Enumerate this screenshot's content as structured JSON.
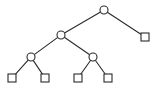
{
  "figure": {
    "width": 159,
    "height": 97,
    "background_color": "#ffffff",
    "stroke_color": "#2b2b2b",
    "node_fill_color": "#ffffff"
  },
  "chart_data": {
    "type": "diagram",
    "diagram_type": "binary-tree",
    "title": "",
    "xlabel": "",
    "ylabel": "",
    "grid": false,
    "legend": "none",
    "node_shapes": {
      "internal": "circle",
      "leaf": "square"
    },
    "node_size": {
      "circle_diameter": 8,
      "square_side": 8
    },
    "nodes": [
      {
        "id": "n0",
        "shape": "circle",
        "level": 0,
        "x": 104,
        "y": 10,
        "label": ""
      },
      {
        "id": "n1",
        "shape": "circle",
        "level": 1,
        "x": 61,
        "y": 35,
        "label": ""
      },
      {
        "id": "n2",
        "shape": "square",
        "level": 1,
        "x": 145,
        "y": 37,
        "label": ""
      },
      {
        "id": "n3",
        "shape": "circle",
        "level": 2,
        "x": 31,
        "y": 57,
        "label": ""
      },
      {
        "id": "n4",
        "shape": "circle",
        "level": 2,
        "x": 93,
        "y": 57,
        "label": ""
      },
      {
        "id": "n5",
        "shape": "square",
        "level": 3,
        "x": 12,
        "y": 78,
        "label": ""
      },
      {
        "id": "n6",
        "shape": "square",
        "level": 3,
        "x": 45,
        "y": 78,
        "label": ""
      },
      {
        "id": "n7",
        "shape": "square",
        "level": 3,
        "x": 78,
        "y": 78,
        "label": ""
      },
      {
        "id": "n8",
        "shape": "square",
        "level": 3,
        "x": 108,
        "y": 78,
        "label": ""
      }
    ],
    "edges": [
      {
        "from": "n0",
        "to": "n1"
      },
      {
        "from": "n0",
        "to": "n2"
      },
      {
        "from": "n1",
        "to": "n3"
      },
      {
        "from": "n1",
        "to": "n4"
      },
      {
        "from": "n3",
        "to": "n5"
      },
      {
        "from": "n3",
        "to": "n6"
      },
      {
        "from": "n4",
        "to": "n7"
      },
      {
        "from": "n4",
        "to": "n8"
      }
    ],
    "counts": {
      "internal_nodes": 4,
      "leaf_nodes": 5,
      "total_nodes": 9,
      "edges": 8,
      "depth": 3
    }
  }
}
